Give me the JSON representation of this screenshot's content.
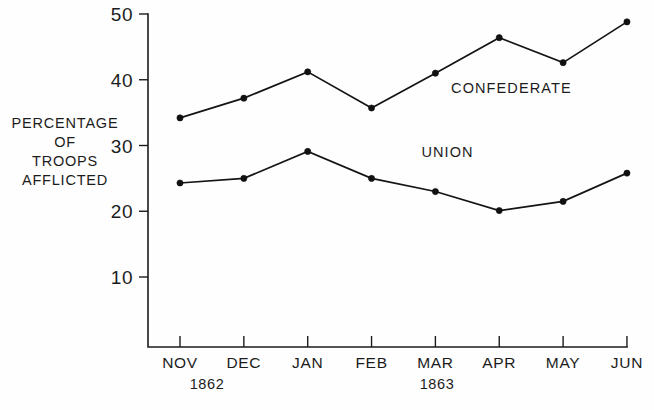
{
  "chart_data": {
    "type": "line",
    "title": "",
    "subtitle": "",
    "xlabel": "",
    "ylabel": "PERCENTAGE OF TROOPS AFFLICTED",
    "ylabel_lines": [
      "PERCENTAGE",
      "OF",
      "TROOPS",
      "AFFLICTED"
    ],
    "categories": [
      "NOV",
      "DEC",
      "JAN",
      "FEB",
      "MAR",
      "APR",
      "MAY",
      "JUN"
    ],
    "ytick_labels": [
      "10",
      "20",
      "30",
      "40",
      "50"
    ],
    "ytick_values": [
      10,
      20,
      30,
      40,
      50
    ],
    "ylim": [
      0,
      50
    ],
    "grid": false,
    "legend_position": "inline-annotation",
    "period_labels": [
      {
        "text": "1862",
        "spans": [
          "NOV",
          "DEC"
        ]
      },
      {
        "text": "1863",
        "spans": [
          "JAN",
          "FEB",
          "MAR",
          "APR",
          "MAY",
          "JUN"
        ]
      }
    ],
    "series": [
      {
        "name": "CONFEDERATE",
        "values": [
          34.2,
          37.2,
          41.2,
          35.7,
          41.0,
          46.4,
          42.6,
          48.8
        ],
        "color": "#141414",
        "label_at": {
          "x_category": "MAR",
          "y_value": 38.0
        }
      },
      {
        "name": "UNION",
        "values": [
          24.3,
          25.0,
          29.1,
          25.0,
          23.0,
          20.1,
          21.5,
          25.8
        ],
        "color": "#141414",
        "label_at": {
          "x_category": "FEB",
          "y_value": 28.3
        }
      }
    ]
  },
  "annotations": {
    "confederate_label": "CONFEDERATE",
    "union_label": "UNION"
  }
}
